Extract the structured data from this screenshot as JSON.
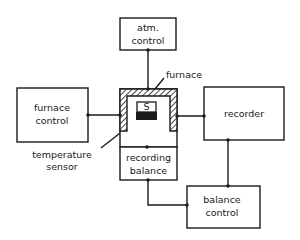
{
  "diagram": {
    "type": "block-diagram",
    "blocks": {
      "atm_control": {
        "line1": "atm.",
        "line2": "control"
      },
      "furnace_control": {
        "line1": "furnace",
        "line2": "control"
      },
      "recorder": {
        "line1": "recorder"
      },
      "recording_balance": {
        "line1": "recording",
        "line2": "balance"
      },
      "balance_control": {
        "line1": "balance",
        "line2": "control"
      }
    },
    "labels": {
      "furnace": "furnace",
      "sample": "S",
      "temperature_sensor_1": "temperature",
      "temperature_sensor_2": "sensor"
    },
    "colors": {
      "ink": "#1a1a1a",
      "background": "#ffffff"
    }
  }
}
